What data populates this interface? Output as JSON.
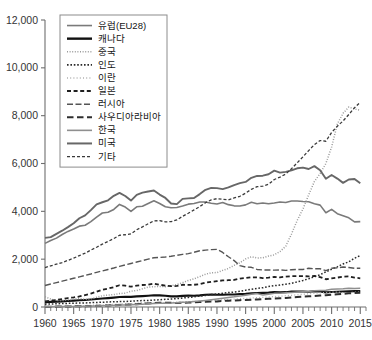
{
  "chart_data": {
    "type": "line",
    "title": "",
    "subtitle": "",
    "xlabel": "",
    "ylabel": "",
    "xlim": [
      1960,
      2016
    ],
    "ylim": [
      0,
      12000
    ],
    "grid": false,
    "legend_position": "top-left",
    "x_tick_labels": [
      "1960",
      "1965",
      "1970",
      "1975",
      "1980",
      "1985",
      "1990",
      "1995",
      "2000",
      "2005",
      "2010",
      "2015"
    ],
    "x_tick_values": [
      1960,
      1965,
      1970,
      1975,
      1980,
      1985,
      1990,
      1995,
      2000,
      2005,
      2010,
      2015
    ],
    "x_minor_step": 1,
    "y_tick_labels": [
      "0",
      "2,000",
      "4,000",
      "6,000",
      "8,000",
      "10,000",
      "12,000"
    ],
    "y_tick_values": [
      0,
      2000,
      4000,
      6000,
      8000,
      10000,
      12000
    ],
    "x": [
      1960,
      1961,
      1962,
      1963,
      1964,
      1965,
      1966,
      1967,
      1968,
      1969,
      1970,
      1971,
      1972,
      1973,
      1974,
      1975,
      1976,
      1977,
      1978,
      1979,
      1980,
      1981,
      1982,
      1983,
      1984,
      1985,
      1986,
      1987,
      1988,
      1989,
      1990,
      1991,
      1992,
      1993,
      1994,
      1995,
      1996,
      1997,
      1998,
      1999,
      2000,
      2001,
      2002,
      2003,
      2004,
      2005,
      2006,
      2007,
      2008,
      2009,
      2010,
      2011,
      2012,
      2013,
      2014,
      2015
    ],
    "series": [
      {
        "name": "유럽(EU28)",
        "style": "solid",
        "color": "#7a7a7a",
        "width": 1.6,
        "values": [
          2660,
          2780,
          2880,
          3030,
          3160,
          3260,
          3380,
          3420,
          3570,
          3760,
          3930,
          3960,
          4080,
          4290,
          4180,
          4000,
          4190,
          4210,
          4330,
          4440,
          4330,
          4190,
          4150,
          4160,
          4220,
          4300,
          4330,
          4390,
          4390,
          4340,
          4310,
          4370,
          4280,
          4230,
          4220,
          4270,
          4380,
          4320,
          4350,
          4320,
          4350,
          4390,
          4370,
          4430,
          4430,
          4410,
          4400,
          4320,
          4260,
          3940,
          4080,
          3900,
          3820,
          3730,
          3560,
          3570
        ]
      },
      {
        "name": "캐나다",
        "style": "solid",
        "color": "#111111",
        "width": 2.1,
        "values": [
          205,
          215,
          225,
          235,
          250,
          265,
          280,
          295,
          315,
          335,
          355,
          370,
          390,
          415,
          425,
          425,
          445,
          455,
          470,
          490,
          485,
          470,
          445,
          445,
          465,
          475,
          470,
          485,
          510,
          520,
          515,
          510,
          520,
          525,
          540,
          555,
          575,
          585,
          590,
          600,
          625,
          615,
          620,
          645,
          650,
          650,
          640,
          660,
          650,
          610,
          630,
          640,
          645,
          655,
          665,
          665
        ]
      },
      {
        "name": "중국",
        "style": "dotted-fine",
        "color": "#9a9a9a",
        "width": 1.5,
        "values": [
          430,
          330,
          275,
          270,
          295,
          325,
          365,
          325,
          340,
          405,
          470,
          500,
          520,
          560,
          580,
          660,
          690,
          760,
          830,
          850,
          860,
          850,
          890,
          940,
          1020,
          1110,
          1180,
          1270,
          1370,
          1430,
          1440,
          1530,
          1610,
          1740,
          1850,
          2010,
          2100,
          2050,
          2060,
          2130,
          2180,
          2320,
          2540,
          3050,
          3620,
          4100,
          4690,
          5250,
          5580,
          6000,
          6690,
          7650,
          8100,
          8360,
          8280,
          8230
        ]
      },
      {
        "name": "인도",
        "style": "dotted-med",
        "color": "#2a2a2a",
        "width": 1.5,
        "values": [
          120,
          125,
          135,
          145,
          150,
          160,
          165,
          170,
          180,
          190,
          200,
          210,
          220,
          225,
          230,
          245,
          260,
          270,
          275,
          290,
          300,
          320,
          335,
          350,
          375,
          400,
          425,
          455,
          485,
          520,
          545,
          575,
          605,
          625,
          655,
          700,
          740,
          780,
          805,
          855,
          895,
          915,
          955,
          990,
          1050,
          1110,
          1180,
          1270,
          1350,
          1470,
          1580,
          1680,
          1800,
          1890,
          2040,
          2150
        ]
      },
      {
        "name": "이란",
        "style": "dotted-fine2",
        "color": "#b0b0b0",
        "width": 1.3,
        "values": [
          30,
          33,
          36,
          40,
          45,
          50,
          56,
          62,
          70,
          78,
          88,
          98,
          110,
          122,
          130,
          140,
          155,
          170,
          180,
          170,
          165,
          175,
          185,
          200,
          210,
          225,
          230,
          240,
          250,
          265,
          280,
          300,
          315,
          330,
          345,
          360,
          375,
          390,
          405,
          420,
          435,
          450,
          470,
          490,
          510,
          530,
          555,
          575,
          590,
          600,
          615,
          625,
          600,
          600,
          615,
          630
        ]
      },
      {
        "name": "일본",
        "style": "dashed-short",
        "color": "#1f1f1f",
        "width": 1.8,
        "values": [
          230,
          265,
          295,
          330,
          375,
          400,
          440,
          500,
          560,
          640,
          725,
          770,
          830,
          910,
          890,
          850,
          895,
          920,
          930,
          975,
          930,
          895,
          870,
          880,
          930,
          925,
          930,
          955,
          1020,
          1050,
          1080,
          1110,
          1120,
          1130,
          1190,
          1210,
          1240,
          1240,
          1210,
          1230,
          1260,
          1240,
          1270,
          1290,
          1290,
          1290,
          1280,
          1300,
          1250,
          1160,
          1200,
          1230,
          1270,
          1280,
          1230,
          1200
        ]
      },
      {
        "name": "러시아",
        "style": "dash-dot",
        "color": "#555555",
        "width": 1.4,
        "values": [
          900,
          960,
          1020,
          1080,
          1140,
          1200,
          1260,
          1320,
          1380,
          1450,
          1510,
          1570,
          1630,
          1700,
          1760,
          1820,
          1880,
          1940,
          2000,
          2060,
          2070,
          2090,
          2120,
          2160,
          2200,
          2230,
          2290,
          2350,
          2380,
          2400,
          2410,
          2280,
          2100,
          1940,
          1730,
          1670,
          1660,
          1570,
          1550,
          1550,
          1540,
          1550,
          1530,
          1560,
          1570,
          1570,
          1620,
          1600,
          1600,
          1520,
          1620,
          1640,
          1670,
          1650,
          1620,
          1620
        ]
      },
      {
        "name": "사우디아라비아",
        "style": "dashed-long",
        "color": "#2e2e2e",
        "width": 2.0,
        "values": [
          12,
          14,
          16,
          19,
          22,
          26,
          30,
          35,
          41,
          48,
          56,
          64,
          74,
          86,
          95,
          105,
          120,
          135,
          150,
          165,
          175,
          180,
          175,
          170,
          180,
          185,
          195,
          205,
          215,
          225,
          235,
          255,
          265,
          275,
          285,
          295,
          305,
          315,
          330,
          340,
          355,
          365,
          375,
          395,
          415,
          430,
          445,
          460,
          480,
          495,
          510,
          530,
          555,
          570,
          585,
          600
        ]
      },
      {
        "name": "한국",
        "style": "solid",
        "color": "#8f8f8f",
        "width": 1.5,
        "values": [
          13,
          14,
          16,
          18,
          21,
          24,
          28,
          33,
          39,
          46,
          54,
          62,
          68,
          80,
          85,
          92,
          105,
          120,
          135,
          150,
          155,
          160,
          165,
          180,
          195,
          205,
          225,
          250,
          275,
          300,
          330,
          365,
          400,
          425,
          455,
          490,
          530,
          560,
          505,
          535,
          570,
          580,
          595,
          610,
          625,
          635,
          650,
          675,
          695,
          700,
          745,
          755,
          760,
          780,
          775,
          780
        ]
      },
      {
        "name": "미국",
        "style": "solid",
        "color": "#676767",
        "width": 1.9,
        "values": [
          2890,
          2920,
          3060,
          3190,
          3340,
          3500,
          3710,
          3830,
          4050,
          4290,
          4380,
          4460,
          4650,
          4770,
          4640,
          4450,
          4690,
          4780,
          4830,
          4870,
          4700,
          4560,
          4330,
          4300,
          4520,
          4540,
          4560,
          4720,
          4900,
          4980,
          4970,
          4930,
          5000,
          5100,
          5180,
          5230,
          5400,
          5480,
          5490,
          5550,
          5700,
          5620,
          5650,
          5710,
          5800,
          5830,
          5770,
          5890,
          5720,
          5360,
          5520,
          5370,
          5190,
          5330,
          5350,
          5170
        ]
      },
      {
        "name": "기타",
        "style": "dash-fine",
        "color": "#3a3a3a",
        "width": 1.3,
        "values": [
          1650,
          1720,
          1790,
          1860,
          1950,
          2040,
          2150,
          2250,
          2380,
          2500,
          2630,
          2740,
          2860,
          3000,
          3020,
          3060,
          3230,
          3350,
          3480,
          3600,
          3610,
          3560,
          3570,
          3640,
          3790,
          3920,
          4060,
          4200,
          4360,
          4480,
          4530,
          4500,
          4480,
          4560,
          4630,
          4760,
          4920,
          5030,
          5050,
          5130,
          5330,
          5430,
          5560,
          5780,
          6030,
          6280,
          6540,
          6790,
          6960,
          6930,
          7300,
          7560,
          7780,
          8050,
          8330,
          8560
        ]
      }
    ]
  },
  "legend": {
    "items": [
      {
        "label": "유럽(EU28)",
        "style": "solid",
        "color": "#7a7a7a",
        "width": 1.6
      },
      {
        "label": "캐나다",
        "style": "solid",
        "color": "#111111",
        "width": 2.4
      },
      {
        "label": "중국",
        "style": "dotted-fine",
        "color": "#9a9a9a",
        "width": 1.5
      },
      {
        "label": "인도",
        "style": "dotted-med",
        "color": "#2a2a2a",
        "width": 1.6
      },
      {
        "label": "이란",
        "style": "dotted-fine2",
        "color": "#b0b0b0",
        "width": 1.4
      },
      {
        "label": "일본",
        "style": "dashed-short",
        "color": "#1f1f1f",
        "width": 1.9
      },
      {
        "label": "러시아",
        "style": "dash-dot",
        "color": "#555555",
        "width": 1.5
      },
      {
        "label": "사우디아라비아",
        "style": "dashed-long",
        "color": "#2e2e2e",
        "width": 2.1
      },
      {
        "label": "한국",
        "style": "solid",
        "color": "#8f8f8f",
        "width": 1.6
      },
      {
        "label": "미국",
        "style": "solid",
        "color": "#676767",
        "width": 2.0
      },
      {
        "label": "기타",
        "style": "dash-fine",
        "color": "#3a3a3a",
        "width": 1.3
      }
    ]
  }
}
